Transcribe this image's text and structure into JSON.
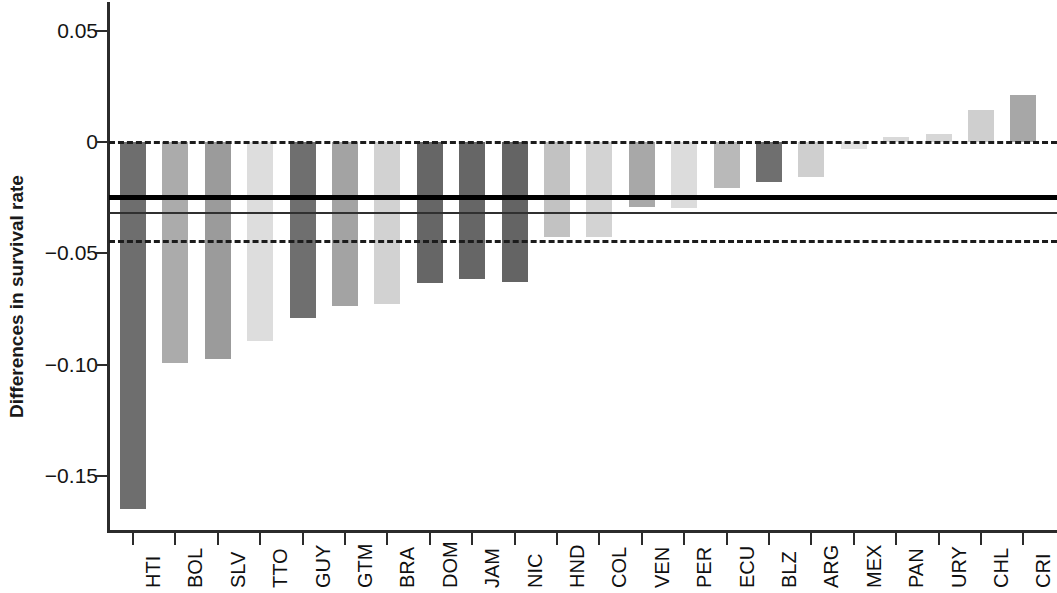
{
  "chart": {
    "type": "bar",
    "ylabel": "Differences in survival rate",
    "xlabel": "",
    "title": ""
  },
  "chart_data": {
    "type": "bar",
    "title": "",
    "xlabel": "",
    "ylabel": "Differences in survival rate",
    "ylim": [
      -0.175,
      0.063
    ],
    "yticks": [
      0.05,
      0,
      -0.05,
      -0.1,
      -0.15
    ],
    "ytick_labels": [
      "0.05",
      "0",
      "−0.05",
      "−0.10",
      "−0.15"
    ],
    "grid": false,
    "legend": "none",
    "categories": [
      "HTI",
      "BOL",
      "SLV",
      "TTO",
      "GUY",
      "GTM",
      "BRA",
      "DOM",
      "JAM",
      "NIC",
      "HND",
      "COL",
      "VEN",
      "PER",
      "ECU",
      "BLZ",
      "ARG",
      "MEX",
      "PAN",
      "URY",
      "CHL",
      "CRI"
    ],
    "values": [
      -0.1645,
      -0.099,
      -0.0973,
      -0.0892,
      -0.079,
      -0.0735,
      -0.0725,
      -0.0635,
      -0.0615,
      -0.063,
      -0.0425,
      -0.0428,
      -0.029,
      -0.0295,
      -0.0205,
      -0.018,
      -0.0158,
      -0.0032,
      0.0022,
      0.0035,
      0.0145,
      0.021
    ],
    "bar_colors": [
      "#6e6e6e",
      "#ababab",
      "#9b9b9b",
      "#dddddd",
      "#6f6f6f",
      "#a3a3a3",
      "#d2d2d2",
      "#666666",
      "#666666",
      "#646464",
      "#c2c2c2",
      "#d3d3d3",
      "#a8a8a8",
      "#dcdcdc",
      "#b9b9b9",
      "#6f6f6f",
      "#cfcfcf",
      "#e2e2e2",
      "#d9d9d9",
      "#d7d7d7",
      "#cfcfcf",
      "#a7a7a7"
    ],
    "reference_lines": [
      {
        "name": "zero-line",
        "value": 0,
        "style": "dashed",
        "color": "#1c1c1c",
        "width": 3
      },
      {
        "name": "mean-estimate-line",
        "value": -0.0248,
        "style": "solid-thick",
        "color": "#000000",
        "width": 5
      },
      {
        "name": "secondary-estimate-line",
        "value": -0.032,
        "style": "solid-thin",
        "color": "#303030",
        "width": 2
      },
      {
        "name": "lower-bound-line",
        "value": -0.0448,
        "style": "dashed",
        "color": "#1c1c1c",
        "width": 3
      }
    ],
    "axis_pixel_mapping": {
      "y_zero_px": 142,
      "px_per_unit": 2228,
      "x_first_bar_left_px": 120,
      "bar_width_px": 26,
      "bar_pitch_px": 42.4
    }
  }
}
